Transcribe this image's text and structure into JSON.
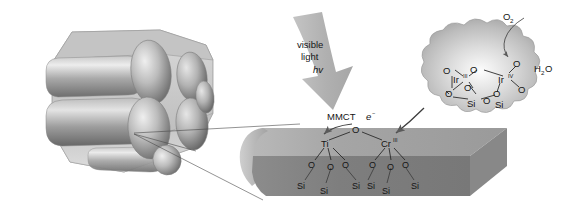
{
  "figure": {
    "light_arrow": {
      "line1": "visible",
      "line2": "light",
      "line3": "hv"
    },
    "mmct": {
      "label": "MMCT",
      "electron": "e",
      "electron_charge": "−"
    },
    "reaction": {
      "product": "O",
      "product_sub": "2",
      "reactant_h": "H",
      "reactant_sub": "2",
      "reactant_o": "O"
    },
    "ir_cluster": {
      "metal_left": "Ir",
      "metal_left_state": "III",
      "metal_right": "Ir",
      "metal_right_state": "IV",
      "oxygens": [
        "O",
        "O",
        "O",
        "O",
        "O",
        "O",
        "O"
      ],
      "silicons": [
        "Si",
        "Si"
      ],
      "bridge_oxygen": "O"
    },
    "surface_unit": {
      "metal_left": "Ti",
      "metal_right": "Cr",
      "metal_right_state": "III",
      "bridge_oxygen": "O",
      "oxygen_row": [
        "O",
        "O",
        "O",
        "O",
        "O",
        "O"
      ],
      "silicon_row": [
        "Si",
        "Si",
        "Si",
        "Si",
        "Si",
        "Si"
      ]
    },
    "crystal": {
      "name": "mesoporous-silica-crystal"
    },
    "colors": {
      "arrow_gray": "#b3b3b3",
      "slab_top": "#9a9a9a",
      "slab_front": "#7d7d7d",
      "cluster_fill": "#c9c9c9",
      "crystal_light": "#d2d2d2",
      "crystal_dark": "#6f6f6f",
      "text": "#151515",
      "bond": "#2b2b2b"
    }
  }
}
